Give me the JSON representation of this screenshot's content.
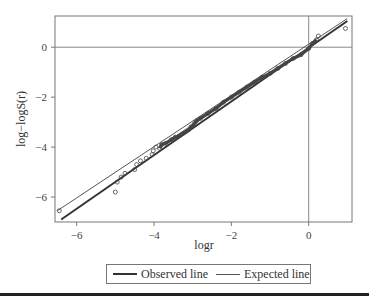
{
  "chart_data": {
    "type": "scatter",
    "title": "",
    "xlabel": "logr",
    "ylabel": "log−logS(r)",
    "xlim": [
      -6.56,
      1.12
    ],
    "ylim": [
      -7.0,
      1.25
    ],
    "x_ticks": [
      -6,
      -4,
      -2,
      0
    ],
    "y_ticks": [
      0,
      -2,
      -4,
      -6
    ],
    "x_tick_labels": [
      "−6",
      "−4",
      "−2",
      "0"
    ],
    "y_tick_labels": [
      "0",
      "−2",
      "−4",
      "−6"
    ],
    "grid": false,
    "reference_lines": {
      "horizontal_y": 0,
      "vertical_x": 0
    },
    "legend_position": "bottom",
    "series": [
      {
        "name": "Observed points",
        "kind": "scatter",
        "marker": "open-circle",
        "x": [
          -6.45,
          -5.0,
          -4.95,
          -4.85,
          -4.75,
          -4.5,
          -4.45,
          -4.35,
          -4.2,
          -4.05,
          -4.02,
          -3.95,
          -3.85,
          -3.8,
          -3.7,
          -3.55,
          -3.45,
          -3.35,
          -3.3,
          -3.25,
          -3.2,
          -3.15,
          -3.1,
          -3.05,
          -3.0,
          -2.95,
          -2.9,
          -2.8,
          -2.6,
          -2.4,
          -2.2,
          -2.0,
          -1.8,
          -1.6,
          -1.4,
          -1.2,
          -1.0,
          -0.8,
          -0.6,
          -0.4,
          -0.2,
          0.0,
          0.1,
          0.2,
          0.25,
          0.95
        ],
        "y": [
          -6.55,
          -5.8,
          -5.4,
          -5.2,
          -5.05,
          -4.9,
          -4.7,
          -4.55,
          -4.45,
          -4.3,
          -4.15,
          -4.0,
          -4.05,
          -3.9,
          -3.85,
          -3.7,
          -3.6,
          -3.55,
          -3.5,
          -3.45,
          -3.4,
          -3.35,
          -3.3,
          -3.2,
          -3.15,
          -3.05,
          -2.95,
          -2.85,
          -2.65,
          -2.45,
          -2.2,
          -2.0,
          -1.8,
          -1.6,
          -1.4,
          -1.2,
          -1.05,
          -0.85,
          -0.65,
          -0.45,
          -0.3,
          -0.05,
          0.15,
          0.3,
          0.45,
          0.75
        ]
      },
      {
        "name": "Observed line",
        "kind": "line",
        "style": "thick",
        "x": [
          -6.4,
          1.0
        ],
        "y": [
          -6.9,
          1.05
        ]
      },
      {
        "name": "Expected line",
        "kind": "line",
        "style": "thin",
        "x": [
          -6.5,
          1.0
        ],
        "y": [
          -6.55,
          1.15
        ]
      }
    ]
  },
  "legend": {
    "observed_label": "Observed line",
    "expected_label": "Expected line"
  },
  "colors": {
    "frame": "#777777",
    "observed_line": "#333333",
    "expected_line": "#555555",
    "points": "#444444"
  }
}
